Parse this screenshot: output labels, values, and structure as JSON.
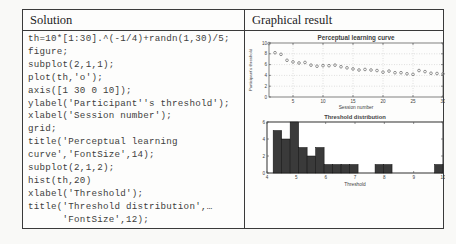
{
  "table": {
    "headers": {
      "solution": "Solution",
      "graphical": "Graphical result"
    },
    "code_lines": [
      "th=10*[1:30].^(-1/4)+randn(1,30)/5;",
      "figure;",
      "subplot(2,1,1);",
      "plot(th,'o');",
      "axis([1 30 0 10]);",
      "ylabel('Participant''s threshold');",
      "xlabel('Session number');",
      "grid;",
      "title('Perceptual learning",
      "curve','FontSize',14);",
      "subplot(2,1,2);",
      "hist(th,20)",
      "xlabel('Threshold');",
      "title('Threshold distribution',…",
      "      'FontSize',12);"
    ]
  },
  "colors": {
    "axis": "#4a4a4a",
    "text": "#3f3f3f",
    "grid": "#b2b2b2",
    "marker": "#7a7a7a",
    "bar_fill": "#3a3a3a",
    "bar_edge": "#0d0d0d"
  },
  "chart_data": [
    {
      "type": "scatter",
      "title": "Perceptual learning curve",
      "xlabel": "Session number",
      "ylabel": "Participant's threshold",
      "xlim": [
        1,
        30
      ],
      "ylim": [
        0,
        10
      ],
      "xticks": [
        5,
        10,
        15,
        20,
        25,
        30
      ],
      "yticks": [
        0,
        2,
        4,
        6,
        8,
        10
      ],
      "grid": true,
      "x": [
        1,
        2,
        3,
        4,
        5,
        6,
        7,
        8,
        9,
        10,
        11,
        12,
        13,
        14,
        15,
        16,
        17,
        18,
        19,
        20,
        21,
        22,
        23,
        24,
        25,
        26,
        27,
        28,
        29,
        30
      ],
      "y": [
        9.9,
        8.2,
        7.9,
        6.8,
        6.5,
        6.3,
        6.4,
        5.9,
        5.7,
        5.8,
        5.8,
        5.9,
        5.6,
        5.4,
        5.2,
        5.0,
        5.1,
        5.0,
        4.9,
        4.6,
        4.8,
        4.5,
        4.5,
        4.3,
        4.2,
        4.9,
        4.7,
        4.4,
        4.35,
        4.3
      ]
    },
    {
      "type": "bar",
      "title": "Threshold distribution",
      "xlabel": "Threshold",
      "xlim": [
        4,
        10
      ],
      "ylim": [
        0,
        6
      ],
      "xticks": [
        4,
        5,
        6,
        7,
        8,
        9,
        10
      ],
      "yticks": [
        0,
        2,
        4,
        6
      ],
      "grid": false,
      "bin_start": 4.21,
      "bin_width": 0.2895,
      "counts": [
        5,
        4,
        6,
        3,
        2,
        3,
        1,
        1,
        1,
        1,
        0,
        0,
        1,
        1,
        0,
        0,
        0,
        0,
        0,
        1
      ]
    }
  ]
}
